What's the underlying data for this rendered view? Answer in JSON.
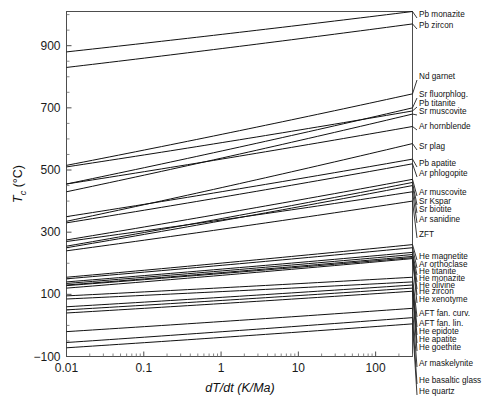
{
  "chart_data": {
    "type": "line",
    "title": "",
    "xlabel": "dT/dt (K/Ma)",
    "ylabel": "T_c (°C)",
    "ylabel_parts": {
      "italic": "T",
      "sub": "c",
      "rest": " (°C)"
    },
    "xscale": "log",
    "yscale": "linear",
    "xlim": [
      0.01,
      300
    ],
    "ylim": [
      -100,
      1010
    ],
    "grid": false,
    "legend_position": "right-outside-labels",
    "xticks": [
      "0.01",
      "0.1",
      "1",
      "10",
      "100"
    ],
    "xtick_values": [
      0.01,
      0.1,
      1,
      10,
      100
    ],
    "yticks": [
      "-100",
      "100",
      "300",
      "500",
      "700",
      "900"
    ],
    "ytick_values": [
      -100,
      100,
      300,
      500,
      700,
      900
    ],
    "series": [
      {
        "name": "Pb monazite",
        "tc_at_0p01": 880,
        "tc_at_300": 1010,
        "label_y": 15
      },
      {
        "name": "Pb zircon",
        "tc_at_0p01": 830,
        "tc_at_300": 970,
        "label_y": 26
      },
      {
        "name": "Nd garnet",
        "tc_at_0p01": 515,
        "tc_at_300": 745,
        "label_y": 77
      },
      {
        "name": "Sr fluorphlog.",
        "tc_at_0p01": 455,
        "tc_at_300": 700,
        "label_y": 95
      },
      {
        "name": "Pb titanite",
        "tc_at_0p01": 510,
        "tc_at_300": 690,
        "label_y": 104
      },
      {
        "name": "Sr muscovite",
        "tc_at_0p01": 430,
        "tc_at_300": 680,
        "label_y": 112
      },
      {
        "name": "Ar hornblende",
        "tc_at_0p01": 455,
        "tc_at_300": 640,
        "label_y": 127
      },
      {
        "name": "Sr plag",
        "tc_at_0p01": 335,
        "tc_at_300": 585,
        "label_y": 147
      },
      {
        "name": "Pb apatite",
        "tc_at_0p01": 350,
        "tc_at_300": 535,
        "label_y": 164
      },
      {
        "name": "Ar phlogopite",
        "tc_at_0p01": 330,
        "tc_at_300": 520,
        "label_y": 174
      },
      {
        "name": "Ar muscovite",
        "tc_at_0p01": 275,
        "tc_at_300": 470,
        "label_y": 193
      },
      {
        "name": "Sr Kspar",
        "tc_at_0p01": 255,
        "tc_at_300": 460,
        "label_y": 202
      },
      {
        "name": "Sr biotite",
        "tc_at_0p01": 250,
        "tc_at_300": 450,
        "label_y": 210
      },
      {
        "name": "Ar sanidine",
        "tc_at_0p01": 270,
        "tc_at_300": 430,
        "label_y": 220
      },
      {
        "name": "ZFT",
        "tc_at_0p01": 240,
        "tc_at_300": 400,
        "label_y": 235
      },
      {
        "name": "He magnetite",
        "tc_at_0p01": 155,
        "tc_at_300": 260,
        "label_y": 257
      },
      {
        "name": "Ar orthoclase",
        "tc_at_0p01": 150,
        "tc_at_300": 250,
        "label_y": 265
      },
      {
        "name": "He titanite",
        "tc_at_0p01": 140,
        "tc_at_300": 235,
        "label_y": 272
      },
      {
        "name": "He monazite",
        "tc_at_0p01": 135,
        "tc_at_300": 228,
        "label_y": 279
      },
      {
        "name": "He olivine",
        "tc_at_0p01": 130,
        "tc_at_300": 222,
        "label_y": 286
      },
      {
        "name": "He zircon",
        "tc_at_0p01": 128,
        "tc_at_300": 218,
        "label_y": 292
      },
      {
        "name": "He xenotyme",
        "tc_at_0p01": 120,
        "tc_at_300": 215,
        "label_y": 300
      },
      {
        "name": "AFT fan. curv.",
        "tc_at_0p01": 95,
        "tc_at_300": 155,
        "label_y": 314
      },
      {
        "name": "AFT fan. lin.",
        "tc_at_0p01": 85,
        "tc_at_300": 140,
        "label_y": 324
      },
      {
        "name": "He epidote",
        "tc_at_0p01": 60,
        "tc_at_300": 130,
        "label_y": 332
      },
      {
        "name": "He apatite",
        "tc_at_0p01": 50,
        "tc_at_300": 120,
        "label_y": 340
      },
      {
        "name": "He goethite",
        "tc_at_0p01": 40,
        "tc_at_300": 110,
        "label_y": 348
      },
      {
        "name": "Ar maskelynite",
        "tc_at_0p01": -20,
        "tc_at_300": 55,
        "label_y": 364
      },
      {
        "name": "He basaltic glass",
        "tc_at_0p01": -55,
        "tc_at_300": 25,
        "label_y": 381
      },
      {
        "name": "He quartz",
        "tc_at_0p01": -72,
        "tc_at_300": 5,
        "label_y": 392
      }
    ]
  },
  "axes": {
    "x_title": "dT/dt (K/Ma)",
    "x_title_italic_head": "d",
    "y_title_sub": "c",
    "y_title_unit": " (°C)"
  }
}
